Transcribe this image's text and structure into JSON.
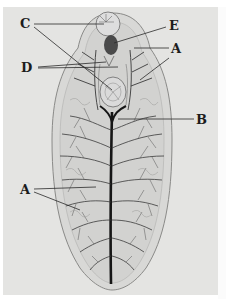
{
  "figure": {
    "labels": [
      {
        "id": "C",
        "text": "C",
        "x": 20,
        "y": 18
      },
      {
        "id": "E",
        "text": "E",
        "x": 168,
        "y": 20
      },
      {
        "id": "A_top",
        "text": "A",
        "x": 171,
        "y": 42
      },
      {
        "id": "D",
        "text": "D",
        "x": 20,
        "y": 60
      },
      {
        "id": "B",
        "text": "B",
        "x": 196,
        "y": 114
      },
      {
        "id": "A_left",
        "text": "A",
        "x": 20,
        "y": 186
      }
    ],
    "colors": {
      "plate": "#e4e4e2",
      "body_fill": "#d6d6d4",
      "outline": "#8a8a88",
      "branches": "#3a3a3a",
      "trunk": "#161616",
      "brain": "#4a4a4a",
      "label": "#1c1c1c"
    }
  }
}
